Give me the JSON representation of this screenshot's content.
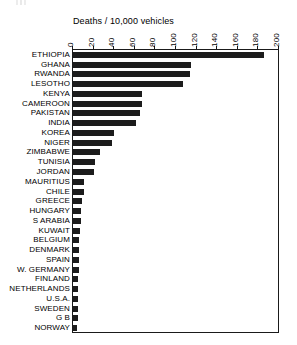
{
  "chart_data": {
    "type": "bar",
    "orientation": "horizontal",
    "title": "Deaths / 10,000 vehicles",
    "xlabel": "",
    "ylabel": "",
    "xlim": [
      0,
      200
    ],
    "xticks": [
      0,
      20,
      40,
      60,
      80,
      100,
      120,
      140,
      160,
      180,
      200
    ],
    "xtick_labels": [
      "0",
      "20",
      "40",
      "60",
      "80",
      "100",
      "120",
      "140",
      "160",
      "180",
      "200"
    ],
    "grid": false,
    "legend": false,
    "bar_color": "#1c1c1c",
    "categories": [
      "ETHIOPIA",
      "GHANA",
      "RWANDA",
      "LESOTHO",
      "KENYA",
      "CAMEROON",
      "PAKISTAN",
      "INDIA",
      "KOREA",
      "NIGER",
      "ZIMBABWE",
      "TUNISIA",
      "JORDAN",
      "MAURITIUS",
      "CHILE",
      "GREECE",
      "HUNGARY",
      "S ARABIA",
      "KUWAIT",
      "BELGIUM",
      "DENMARK",
      "SPAIN",
      "W. GERMANY",
      "FINLAND",
      "NETHERLANDS",
      "U.S.A.",
      "SWEDEN",
      "G B",
      "NORWAY"
    ],
    "values": [
      185,
      115,
      114,
      107,
      67,
      67,
      65,
      61,
      40,
      38,
      26,
      21,
      20,
      11,
      11,
      9,
      8,
      8,
      7,
      6,
      6,
      6,
      6,
      5,
      5,
      5,
      5,
      5,
      4
    ]
  }
}
